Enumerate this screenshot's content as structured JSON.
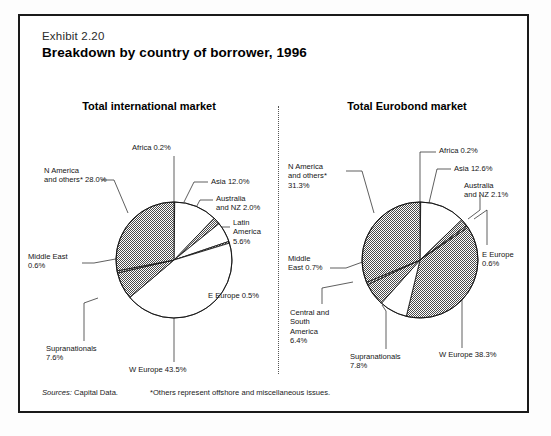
{
  "exhibit": {
    "number": "Exhibit 2.20",
    "title": "Breakdown by country of borrower, 1996"
  },
  "footer": {
    "source_label": "Sources:",
    "source_value": " Capital Data.",
    "footnote": "*Others represent offshore and miscellaneous issues."
  },
  "charts": [
    {
      "id": "total-international-market",
      "title": "Total international market",
      "center": {
        "x": 150,
        "y": 160
      },
      "radius": 58,
      "start_angle": -90,
      "chart_data": {
        "type": "pie",
        "title": "Total international market",
        "unit": "%",
        "categories": [
          "Africa",
          "Asia",
          "Australia and NZ",
          "Latin America",
          "E Europe",
          "W Europe",
          "Supranationals",
          "Middle East",
          "N America and others*"
        ],
        "values": [
          0.2,
          12.0,
          2.0,
          5.6,
          0.5,
          43.5,
          7.6,
          0.6,
          28.0
        ],
        "shaded": [
          false,
          false,
          true,
          false,
          true,
          false,
          true,
          true,
          true
        ],
        "legend_position": "callout-labels"
      },
      "labels": [
        {
          "name": "africa",
          "text": "Africa 0.2%",
          "x": 108,
          "y": 43,
          "align": "left"
        },
        {
          "name": "asia",
          "text": "Asia 12.0%",
          "x": 187,
          "y": 77,
          "align": "left"
        },
        {
          "name": "australia-nz",
          "text": "Australia\nand NZ 2.0%",
          "x": 192,
          "y": 94,
          "align": "left"
        },
        {
          "name": "latin-america",
          "text": "Latin\nAmerica\n5.6%",
          "x": 209,
          "y": 118,
          "align": "left"
        },
        {
          "name": "e-europe",
          "text": "E Europe 0.5%",
          "x": 184,
          "y": 191,
          "align": "left"
        },
        {
          "name": "w-europe",
          "text": "W Europe 43.5%",
          "x": 105,
          "y": 265,
          "align": "left"
        },
        {
          "name": "supranationals",
          "text": "Supranationals\n7.6%",
          "x": 22,
          "y": 244,
          "align": "left"
        },
        {
          "name": "middle-east",
          "text": "Middle East\n0.6%",
          "x": 4,
          "y": 152,
          "align": "left"
        },
        {
          "name": "n-america",
          "text": "N America\nand others* 28.0%",
          "x": 20,
          "y": 66,
          "align": "left"
        }
      ],
      "leaders": [
        {
          "name": "africa",
          "points": "150,56 150,102"
        },
        {
          "name": "asia",
          "points": "184,82 170,82 160,102"
        },
        {
          "name": "australia-nz",
          "points": "189,100 176,100 167,117"
        },
        {
          "name": "latin-america",
          "points": "206,127 190,127 178,139"
        },
        {
          "name": "e-europe",
          "points": "181,194 170,194 170,146"
        },
        {
          "name": "w-europe",
          "points": "150,262 150,218"
        },
        {
          "name": "supranationals",
          "points": "60,241 60,203 74,198"
        },
        {
          "name": "middle-east",
          "points": "58,163 70,163 97,158"
        },
        {
          "name": "n-america",
          "points": "77,80 90,80 104,113"
        }
      ]
    },
    {
      "id": "total-eurobond-market",
      "title": "Total Eurobond market",
      "center": {
        "x": 138,
        "y": 160
      },
      "radius": 58,
      "start_angle": -90,
      "chart_data": {
        "type": "pie",
        "title": "Total Eurobond market",
        "unit": "%",
        "categories": [
          "Africa",
          "Asia",
          "Australia and NZ",
          "E Europe",
          "W Europe",
          "Supranationals",
          "Central and South America",
          "Middle East",
          "N America and others*"
        ],
        "values": [
          0.2,
          12.6,
          2.1,
          0.6,
          38.3,
          7.8,
          6.4,
          0.7,
          31.3
        ],
        "shaded": [
          false,
          false,
          true,
          true,
          true,
          false,
          true,
          true,
          true
        ],
        "legend_position": "callout-labels"
      },
      "labels": [
        {
          "name": "africa",
          "text": "Africa 0.2%",
          "x": 157,
          "y": 46,
          "align": "left"
        },
        {
          "name": "asia",
          "text": "Asia 12.6%",
          "x": 172,
          "y": 64,
          "align": "left"
        },
        {
          "name": "australia-nz",
          "text": "Australia\nand NZ 2.1%",
          "x": 182,
          "y": 81,
          "align": "left"
        },
        {
          "name": "e-europe",
          "text": "E Europe\n0.6%",
          "x": 200,
          "y": 150,
          "align": "left"
        },
        {
          "name": "w-europe",
          "text": "W Europe 38.3%",
          "x": 157,
          "y": 250,
          "align": "left"
        },
        {
          "name": "supranationals",
          "text": "Supranationals\n7.8%",
          "x": 68,
          "y": 252,
          "align": "left"
        },
        {
          "name": "central-south",
          "text": "Central and\nSouth\nAmerica\n6.4%",
          "x": 8,
          "y": 208,
          "align": "left"
        },
        {
          "name": "middle-east",
          "text": "Middle\nEast 0.7%",
          "x": 6,
          "y": 154,
          "align": "left"
        },
        {
          "name": "n-america",
          "text": "N America\nand others*\n31.3%",
          "x": 6,
          "y": 62,
          "align": "left"
        }
      ],
      "leaders": [
        {
          "name": "africa",
          "points": "154,52 138,52 138,102"
        },
        {
          "name": "asia",
          "points": "169,69 155,69 147,103"
        },
        {
          "name": "australia-nz",
          "points": "198,95 198,110 186,119"
        },
        {
          "name": "e-europe",
          "points": "205,145 205,110 192,119"
        },
        {
          "name": "w-europe",
          "points": "180,248 180,200 169,191"
        },
        {
          "name": "supranationals",
          "points": "104,249 104,211 100,205"
        },
        {
          "name": "middle-east",
          "points": "48,168 64,168 86,160"
        },
        {
          "name": "central-south",
          "points": "40,204 40,188 71,182"
        },
        {
          "name": "n-america",
          "points": "64,71 80,71 92,113"
        }
      ]
    }
  ]
}
